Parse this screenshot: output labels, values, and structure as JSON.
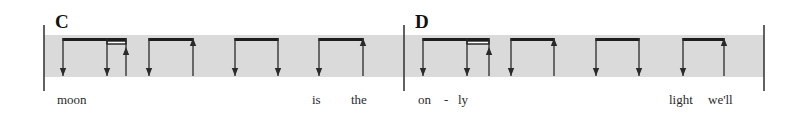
{
  "colors": {
    "background": "#ffffff",
    "band": "#dadada",
    "ink": "#1e1e1e"
  },
  "geometry": {
    "band_top": 35,
    "band_bottom": 77,
    "beam_y": 38,
    "beam_thickness": 3,
    "secondary_beam_y": 41,
    "secondary_beam_height": 3,
    "stem_bottom": 76,
    "barline_top": 25,
    "barline_bottom": 91,
    "lyric_baseline": 104
  },
  "measures": [
    {
      "label": "C",
      "label_x": 55,
      "label_y": 28,
      "barline_left_x": 44,
      "band_start_x": 44,
      "band_end_x": 404,
      "beat_groups": [
        {
          "beam_from": 63,
          "beam_to": 126,
          "secondary_beam": {
            "from": 107,
            "to": 126
          },
          "strokes": [
            {
              "x": 63,
              "dir": "down"
            },
            {
              "x": 107,
              "dir": "down"
            },
            {
              "x": 126,
              "dir": "up"
            }
          ]
        },
        {
          "beam_from": 149,
          "beam_to": 193,
          "strokes": [
            {
              "x": 149,
              "dir": "down"
            },
            {
              "x": 193,
              "dir": "up"
            }
          ]
        },
        {
          "beam_from": 235,
          "beam_to": 278,
          "strokes": [
            {
              "x": 235,
              "dir": "down"
            },
            {
              "x": 278,
              "dir": "down"
            }
          ]
        },
        {
          "beam_from": 319,
          "beam_to": 363,
          "strokes": [
            {
              "x": 319,
              "dir": "down"
            },
            {
              "x": 363,
              "dir": "up"
            }
          ]
        }
      ],
      "lyrics": [
        {
          "text": "moon",
          "x": 57
        },
        {
          "text": "is",
          "x": 312
        },
        {
          "text": "the",
          "x": 351
        }
      ]
    },
    {
      "label": "D",
      "label_x": 415,
      "label_y": 28,
      "barline_left_x": 404,
      "band_start_x": 404,
      "band_end_x": 764,
      "barline_right_x": 764,
      "beat_groups": [
        {
          "beam_from": 423,
          "beam_to": 489,
          "secondary_beam": {
            "from": 467,
            "to": 489
          },
          "strokes": [
            {
              "x": 423,
              "dir": "down"
            },
            {
              "x": 467,
              "dir": "down"
            },
            {
              "x": 489,
              "dir": "up"
            }
          ]
        },
        {
          "beam_from": 511,
          "beam_to": 554,
          "strokes": [
            {
              "x": 511,
              "dir": "down"
            },
            {
              "x": 554,
              "dir": "up"
            }
          ]
        },
        {
          "beam_from": 596,
          "beam_to": 639,
          "strokes": [
            {
              "x": 596,
              "dir": "down"
            },
            {
              "x": 639,
              "dir": "down"
            }
          ]
        },
        {
          "beam_from": 683,
          "beam_to": 724,
          "strokes": [
            {
              "x": 683,
              "dir": "down"
            },
            {
              "x": 724,
              "dir": "up"
            }
          ]
        }
      ],
      "lyrics": [
        {
          "text": "on",
          "x": 418
        },
        {
          "text": "-",
          "x": 444
        },
        {
          "text": "ly",
          "x": 458
        },
        {
          "text": "light",
          "x": 669
        },
        {
          "text": "we'll",
          "x": 708
        }
      ]
    }
  ]
}
